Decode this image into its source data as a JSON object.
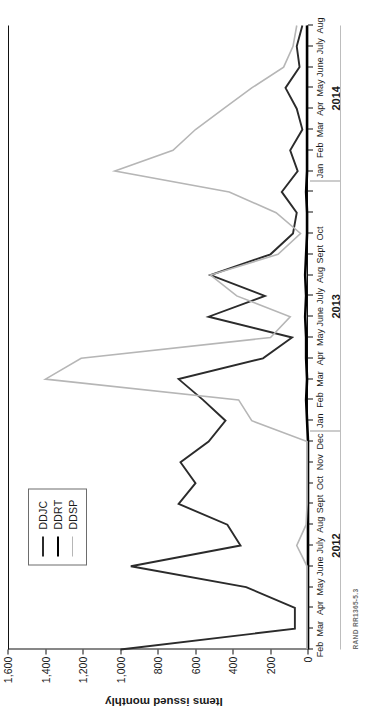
{
  "figure": {
    "source_note": "RAND RR1365-5.3",
    "rotation_note": "figure printed rotated 90 degrees on the page"
  },
  "legend": {
    "position": "top-left inside plot",
    "entries": [
      {
        "label": "DDJC",
        "color": "#2b2b2b",
        "width": 1.9
      },
      {
        "label": "DDRT",
        "color": "#000000",
        "width": 2.6
      },
      {
        "label": "DDSP",
        "color": "#b6b6b6",
        "width": 1.6
      }
    ]
  },
  "chart_data": {
    "type": "line",
    "title": "",
    "subtitle": "",
    "xlabel": "",
    "ylabel": "Items issued monthly",
    "ylim": [
      0,
      1600
    ],
    "yticks": [
      0,
      200,
      400,
      600,
      800,
      1000,
      1200,
      1400,
      1600
    ],
    "ytick_labels": [
      "0",
      "200",
      "400",
      "600",
      "800",
      "1,000",
      "1,200",
      "1,400",
      "1,600"
    ],
    "grid": false,
    "legend_entries": [
      "DDJC",
      "DDRT",
      "DDSP"
    ],
    "x": [
      "Feb",
      "Mar",
      "Apr",
      "May",
      "June",
      "July",
      "Aug",
      "Sept",
      "Oct",
      "Nov",
      "Dec",
      "Jan",
      "Feb",
      "Mar",
      "Apr",
      "May",
      "June",
      "July",
      "Aug",
      "Sept",
      "Oct",
      "Nov",
      "Dec",
      "Jan",
      "Feb",
      "Mar",
      "Apr",
      "May",
      "June",
      "July",
      "Aug"
    ],
    "xtick_labels": [
      "Feb",
      "Mar",
      "Apr",
      "May",
      "June",
      "July",
      "Aug",
      "Sept",
      "Oct",
      "Nov",
      "Dec",
      "Jan",
      "Feb",
      "Mar",
      "Apr",
      "May",
      "June",
      "July",
      "Aug",
      "Sept",
      "Oct",
      "",
      "",
      "Jan",
      "Feb",
      "Mar",
      "Apr",
      "May",
      "June",
      "July",
      "Aug"
    ],
    "year_groups": [
      {
        "label": "2012",
        "start_index": 0,
        "end_index": 10
      },
      {
        "label": "2013",
        "start_index": 11,
        "end_index": 22
      },
      {
        "label": "2014",
        "start_index": 23,
        "end_index": 30
      }
    ],
    "series": [
      {
        "name": "DDJC",
        "color": "#2b2b2b",
        "width": 1.9,
        "values": [
          1000,
          70,
          70,
          330,
          945,
          360,
          430,
          690,
          600,
          680,
          530,
          440,
          560,
          690,
          240,
          85,
          530,
          230,
          520,
          200,
          80,
          60,
          140,
          55,
          95,
          30,
          60,
          120,
          45,
          60,
          30
        ]
      },
      {
        "name": "DDRT",
        "color": "#000000",
        "width": 2.6,
        "values": [
          0,
          0,
          0,
          0,
          0,
          0,
          0,
          0,
          0,
          0,
          0,
          5,
          10,
          5,
          10,
          10,
          15,
          10,
          15,
          10,
          5,
          5,
          10,
          5,
          5,
          5,
          5,
          5,
          5,
          5,
          5
        ]
      },
      {
        "name": "DDSP",
        "color": "#b6b6b6",
        "width": 1.6,
        "values": [
          5,
          5,
          5,
          5,
          5,
          60,
          10,
          5,
          5,
          5,
          5,
          300,
          370,
          1400,
          1210,
          200,
          95,
          380,
          520,
          160,
          40,
          170,
          420,
          1030,
          720,
          600,
          450,
          300,
          130,
          80,
          60
        ]
      }
    ]
  }
}
